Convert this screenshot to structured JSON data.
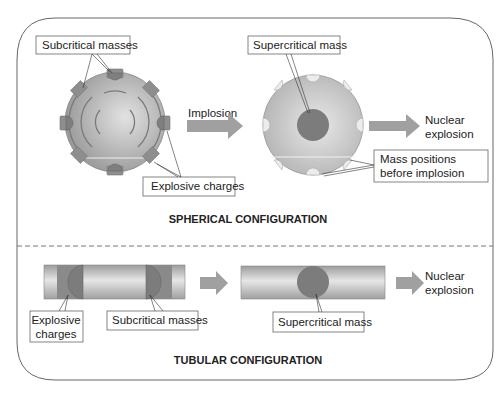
{
  "spherical": {
    "title": "SPHERICAL CONFIGURATION",
    "labels": {
      "subcritical_masses": "Subcritical masses",
      "explosive_charges": "Explosive charges",
      "implosion": "Implosion",
      "supercritical_mass": "Supercritical mass",
      "nuclear_explosion_line1": "Nuclear",
      "nuclear_explosion_line2": "explosion",
      "mass_positions_line1": "Mass positions",
      "mass_positions_line2": "before implosion"
    }
  },
  "tubular": {
    "title": "TUBULAR CONFIGURATION",
    "labels": {
      "explosive_charges_line1": "Explosive",
      "explosive_charges_line2": "charges",
      "subcritical_masses": "Subcritical masses",
      "supercritical_mass": "Supercritical mass",
      "nuclear_explosion_line1": "Nuclear",
      "nuclear_explosion_line2": "explosion"
    }
  },
  "colors": {
    "sphere": "#a8a8a8",
    "charge": "#8c8c8c",
    "core": "#7a7a7a",
    "arrow": "#a0a0a0",
    "border": "#555555"
  }
}
